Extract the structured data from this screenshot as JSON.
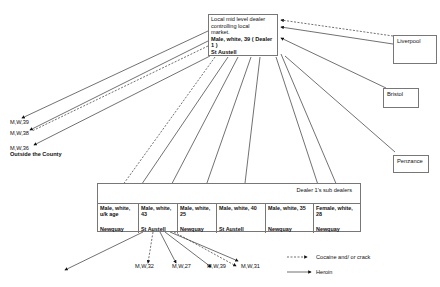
{
  "main_dealer": {
    "line1": "Local mid level dealer",
    "line2": "controlling  local",
    "line3": "market.",
    "line4": "Male, white, 39 ( Dealer",
    "line5": "1 )",
    "line6": "St Austell"
  },
  "sources": [
    {
      "name": "Liverpool"
    },
    {
      "name": "Bristol"
    },
    {
      "name": "Penzance"
    }
  ],
  "outside_county": {
    "labels": [
      "M,W,39",
      "M,W,38",
      "M,W,36"
    ],
    "caption": "Outside the County"
  },
  "sub_dealers": {
    "header": "Dealer 1's sub dealers",
    "cells": [
      {
        "desc": "Male, white, u/k age",
        "location": "Newquay"
      },
      {
        "desc": "Male, white, 43",
        "location": "St Austell"
      },
      {
        "desc": "Male, white, 25",
        "location": "Newquay"
      },
      {
        "desc": "Male, white, 40",
        "location": "St Austell"
      },
      {
        "desc": "Male, white, 35",
        "location": "Newquay"
      },
      {
        "desc": "Female, white, 28",
        "location": "Newquay"
      }
    ]
  },
  "second_tier": {
    "labels": [
      "M,W,32",
      "M,W,27",
      "M,W,39",
      "M,W,31"
    ]
  },
  "legend": {
    "dashed": "Cocaine and/ or crack",
    "solid": "Heroin"
  },
  "colors": {
    "line": "#333333",
    "border": "#777777"
  }
}
